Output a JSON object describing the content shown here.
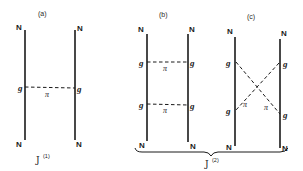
{
  "figure": {
    "panels": [
      {
        "id": "a",
        "label": "(a)",
        "nucleon_label": "N",
        "vertex_label": "g",
        "exchange_label": "π",
        "exchanges": 1,
        "topology": "single pion exchange"
      },
      {
        "id": "b",
        "label": "(b)",
        "nucleon_label": "N",
        "vertex_label": "g",
        "exchange_label": "π",
        "exchanges": 2,
        "topology": "ladder (two uncrossed pion exchanges)"
      },
      {
        "id": "c",
        "label": "(c)",
        "nucleon_label": "N",
        "vertex_label": "g",
        "exchange_label": "π",
        "exchanges": 2,
        "topology": "crossed (two crossed pion exchanges)"
      }
    ],
    "group_labels": {
      "order1": {
        "symbol": "J",
        "superscript": "(1)"
      },
      "order2": {
        "symbol": "J",
        "superscript": "(2)"
      }
    }
  },
  "colors": {
    "line": "#1a1a1a",
    "background": "#ffffff"
  }
}
